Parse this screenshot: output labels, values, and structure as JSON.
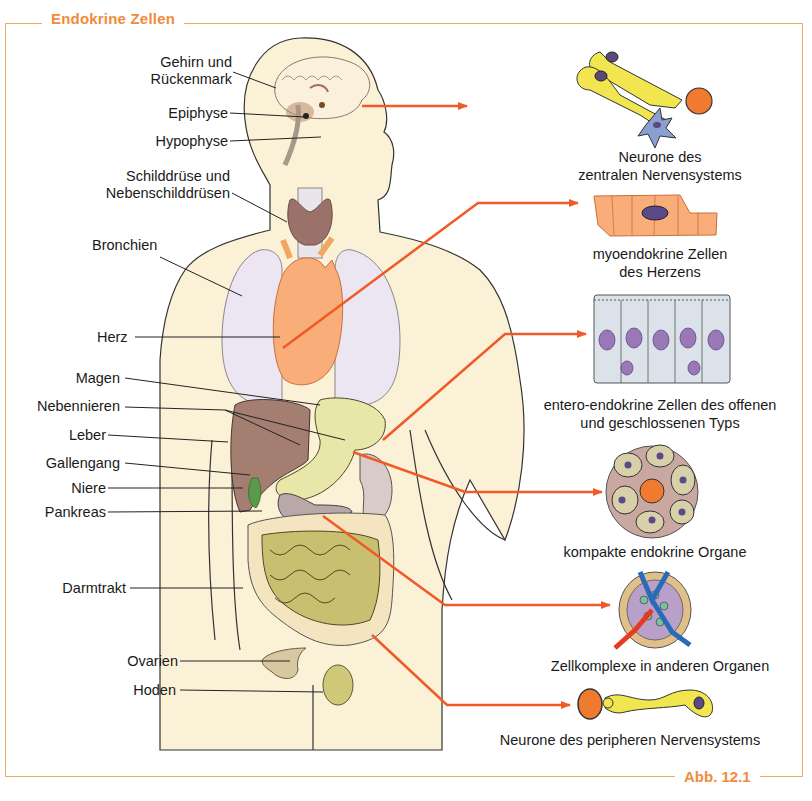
{
  "figure": {
    "title": "Endokrine Zellen",
    "figure_number": "Abb. 12.1",
    "accent_color": "#f08c3c",
    "arrow_color": "#f05a28",
    "body_fill": "#fbf1d6"
  },
  "organ_labels": [
    {
      "id": "gehirn",
      "line1": "Gehirn und",
      "line2": "Rückenmark"
    },
    {
      "id": "epiphyse",
      "text": "Epiphyse"
    },
    {
      "id": "hypophyse",
      "text": "Hypophyse"
    },
    {
      "id": "schilddruese",
      "line1": "Schilddrüse und",
      "line2": "Nebenschilddrüsen"
    },
    {
      "id": "bronchien",
      "text": "Bronchien"
    },
    {
      "id": "herz",
      "text": "Herz"
    },
    {
      "id": "magen",
      "text": "Magen"
    },
    {
      "id": "nebennieren",
      "text": "Nebennieren"
    },
    {
      "id": "leber",
      "text": "Leber"
    },
    {
      "id": "gallengang",
      "text": "Gallengang"
    },
    {
      "id": "niere",
      "text": "Niere"
    },
    {
      "id": "pankreas",
      "text": "Pankreas"
    },
    {
      "id": "darmtrakt",
      "text": "Darmtrakt"
    },
    {
      "id": "ovarien",
      "text": "Ovarien"
    },
    {
      "id": "hoden",
      "text": "Hoden"
    }
  ],
  "cell_types": [
    {
      "id": "zns",
      "line1": "Neurone des",
      "line2": "zentralen Nervensystems"
    },
    {
      "id": "myo",
      "line1": "myoendokrine Zellen",
      "line2": "des Herzens"
    },
    {
      "id": "entero",
      "line1": "entero-endokrine Zellen des offenen",
      "line2": "und geschlossenen Typs"
    },
    {
      "id": "kompakt",
      "text": "kompakte endokrine Organe"
    },
    {
      "id": "zellkomplexe",
      "text": "Zellkomplexe in anderen Organen"
    },
    {
      "id": "pns",
      "text": "Neurone des peripheren Nervensystems"
    }
  ]
}
